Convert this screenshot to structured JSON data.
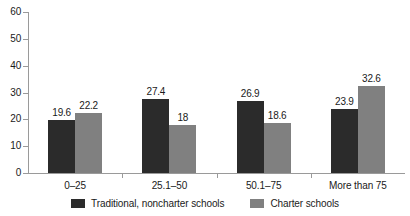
{
  "chart_data": {
    "type": "bar",
    "title": "",
    "xlabel": "",
    "ylabel": "",
    "ylim": [
      0,
      60
    ],
    "yticks": [
      0,
      10,
      20,
      30,
      40,
      50,
      60
    ],
    "ytick_labels": [
      "0",
      "10",
      "20",
      "30",
      "40",
      "50",
      "60"
    ],
    "grid": false,
    "legend_position": "bottom-center",
    "categories": [
      "0–25",
      "25.1–50",
      "50.1–75",
      "More than 75"
    ],
    "series": [
      {
        "name": "Traditional, noncharter schools",
        "color": "#2b2b2b",
        "values": [
          19.6,
          27.4,
          26.9,
          23.9
        ],
        "labels": [
          "19.6",
          "27.4",
          "26.9",
          "23.9"
        ]
      },
      {
        "name": "Charter schools",
        "color": "#808080",
        "values": [
          22.2,
          18,
          18.6,
          32.6
        ],
        "labels": [
          "22.2",
          "18",
          "18.6",
          "32.6"
        ]
      }
    ]
  },
  "axis": {
    "y_tick_labels": [
      "60",
      "50",
      "40",
      "30",
      "20",
      "10",
      "0"
    ]
  },
  "legend": {
    "items": [
      {
        "label": "Traditional, noncharter schools",
        "swatch": "dark-square-swatch"
      },
      {
        "label": "Charter schools",
        "swatch": "gray-square-swatch"
      }
    ]
  },
  "colors": {
    "traditional": "#2b2b2b",
    "charter": "#808080",
    "axis": "#9a9a9a",
    "text": "#1a1a1a",
    "background": "#ffffff"
  }
}
